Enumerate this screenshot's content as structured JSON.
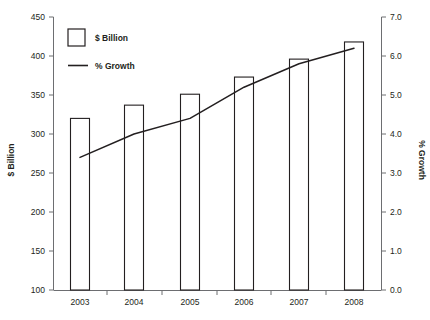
{
  "chart_data": {
    "type": "bar",
    "title": "",
    "subtitle": "",
    "categories": [
      "2003",
      "2004",
      "2005",
      "2006",
      "2007",
      "2008"
    ],
    "series": [
      {
        "name": "$ Billion",
        "type": "bar",
        "axis": "left",
        "values": [
          320,
          337,
          351,
          373,
          396,
          418
        ]
      },
      {
        "name": "% Growth",
        "type": "line",
        "axis": "right",
        "values": [
          3.4,
          4.0,
          4.4,
          5.2,
          5.8,
          6.2
        ]
      }
    ],
    "xlabel": "",
    "ylabel": "$ Billion",
    "y2label": "% Growth",
    "ylim": [
      100,
      450
    ],
    "y2lim": [
      0.0,
      7.0
    ],
    "yticks": [
      "450",
      "400",
      "350",
      "300",
      "250",
      "200",
      "150",
      "100"
    ],
    "y2ticks": [
      "7.0",
      "6.0",
      "5.0",
      "4.0",
      "3.0",
      "2.0",
      "1.0",
      "0.0"
    ],
    "xticks": [
      "2003",
      "2004",
      "2005",
      "2006",
      "2007",
      "2008"
    ],
    "grid": false,
    "legend_position": "top-left",
    "legend": [
      {
        "label": "$ Billion",
        "marker": "square-outline"
      },
      {
        "label": "% Growth",
        "marker": "line"
      }
    ],
    "colors": {
      "bar_fill": "#ffffff",
      "bar_stroke": "#231f20",
      "line": "#231f20",
      "axis": "#6d6e71",
      "text": "#231f20",
      "background": "#ffffff"
    }
  }
}
